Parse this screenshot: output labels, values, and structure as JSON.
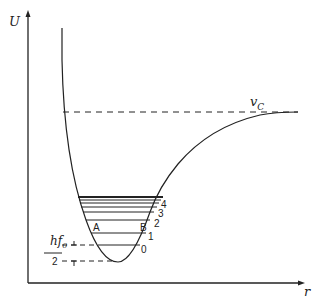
{
  "diagram": {
    "type": "potential-energy-curve",
    "axes": {
      "y_label": "U",
      "x_label": "r"
    },
    "dissociation_label": "v_C",
    "dissociation_label_main": "v",
    "dissociation_label_sub": "C",
    "zero_point_label": {
      "numerator": "hf",
      "subscript": "0",
      "denominator": "2"
    },
    "level_labels": [
      "0",
      "1",
      "2",
      "3",
      "4"
    ],
    "turning_points": [
      "A",
      "B"
    ],
    "colors": {
      "line": "#222222",
      "background": "#ffffff"
    }
  }
}
